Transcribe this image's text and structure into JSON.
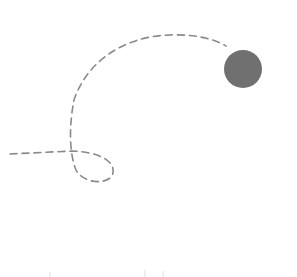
{
  "diagram": {
    "type": "trajectory",
    "background": "#ffffff",
    "path": {
      "style": "dashed",
      "color": "#8a8a8a",
      "d": "M 10 154 L 72 151 C 100 152 118 162 112 176 C 104 186 82 182 76 170 C 68 150 70 120 74 100 C 84 70 110 45 150 37 C 180 32 210 36 226 46"
    },
    "ball": {
      "cx": 243,
      "cy": 69,
      "r": 19,
      "color": "#707070"
    }
  }
}
